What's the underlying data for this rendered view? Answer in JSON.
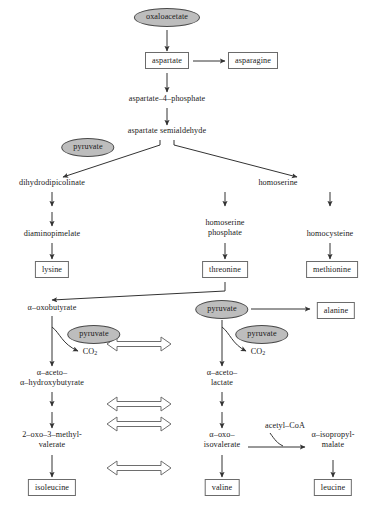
{
  "diagram": {
    "colors": {
      "background": "#ffffff",
      "ellipse_fill": "#bdbdbd",
      "stroke": "#4a4a4a",
      "box_stroke": "#6b6b6b",
      "text": "#1a1a1a"
    },
    "nodes": {
      "oxaloacetate": "oxaloacetate",
      "aspartate": "aspartate",
      "asparagine": "asparagine",
      "aspartate_4_phosphate": "aspartate–4–phosphate",
      "aspartate_semialdehyde": "aspartate semialdehyde",
      "pyruvate_1": "pyruvate",
      "dihydrodipicolinate": "dihydrodipicolinate",
      "homoserine": "homoserine",
      "diaminopimelate": "diaminopimelate",
      "homoserine_phosphate_l1": "homoserine",
      "homoserine_phosphate_l2": "phosphate",
      "homocysteine": "homocysteine",
      "lysine": "lysine",
      "threonine": "threonine",
      "methionine": "methionine",
      "alpha_oxobutyrate": "α–oxobutyrate",
      "pyruvate_2": "pyruvate",
      "co2_left": "CO",
      "co2_left_sub": "2",
      "pyruvate_3": "pyruvate",
      "pyruvate_4": "pyruvate",
      "co2_right": "CO",
      "co2_right_sub": "2",
      "alanine": "alanine",
      "alpha_aceto_hydroxybutyrate_l1": "α–aceto–",
      "alpha_aceto_hydroxybutyrate_l2": "α–hydroxybutyrate",
      "alpha_aceto_lactate_l1": "α–aceto–",
      "alpha_aceto_lactate_l2": "lactate",
      "oxo_methylvalerate_l1": "2–oxo–3–methyl-",
      "oxo_methylvalerate_l2": "valerate",
      "alpha_oxo_isovalerate_l1": "α–oxo–",
      "alpha_oxo_isovalerate_l2": "isovalerate",
      "acetyl_coa": "acetyl–CoA",
      "alpha_isopropylmalate_l1": "α–isopropyl-",
      "alpha_isopropylmalate_l2": "malate",
      "isoleucine": "isoleucine",
      "valine": "valine",
      "leucine": "leucine"
    }
  }
}
